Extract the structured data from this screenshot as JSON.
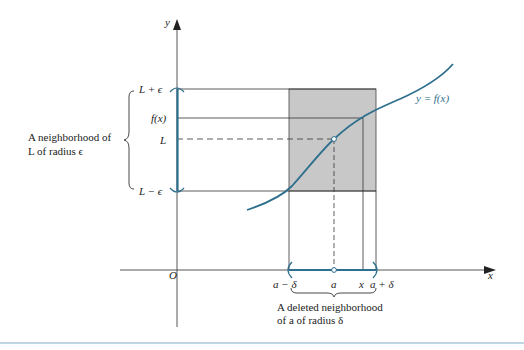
{
  "axes": {
    "y_label": "y",
    "x_label": "x",
    "origin_label": "O"
  },
  "y_ticks": {
    "L_plus_eps": "L + ϵ",
    "fx": "f(x)",
    "L": "L",
    "L_minus_eps": "L − ϵ"
  },
  "x_ticks": {
    "a_minus_delta": "a − δ",
    "a": "a",
    "x": "x",
    "a_plus_delta": "a + δ"
  },
  "annotations": {
    "eps_neighborhood_line1": "A neighborhood of",
    "eps_neighborhood_line2": "L of radius ϵ",
    "delta_neighborhood_line1": "A deleted neighborhood",
    "delta_neighborhood_line2": "of a of radius δ",
    "curve_label": "y = f(x)"
  },
  "colors": {
    "curve": "#2e6f8e",
    "shade": "#c8c8c8",
    "axis": "#333333",
    "bottom_rule": "#a9c7d8"
  }
}
